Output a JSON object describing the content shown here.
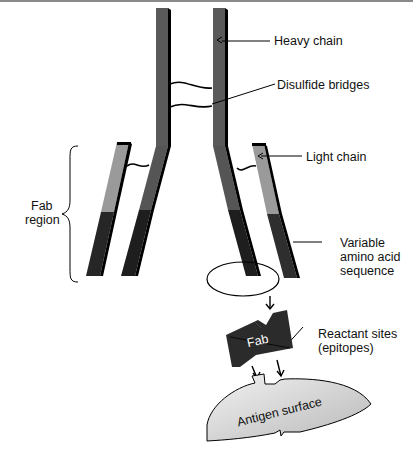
{
  "figure": {
    "labels": {
      "heavy_chain": "Heavy chain",
      "disulfide_bridges": "Disulfide bridges",
      "light_chain": "Light chain",
      "fab_region_line1": "Fab",
      "fab_region_line2": "region",
      "variable_line1": "Variable",
      "variable_line2": "amino acid",
      "variable_line3": "sequence",
      "reactant_line1": "Reactant sites",
      "reactant_line2": "(epitopes)",
      "fab": "Fab",
      "antigen_surface": "Antigen surface"
    },
    "colors": {
      "heavy_chain": "#5a5a5a",
      "light_chain_constant": "#9a9a9a",
      "variable_region": "#262626",
      "antigen": "#d4d4d4",
      "outline": "#000000"
    }
  }
}
